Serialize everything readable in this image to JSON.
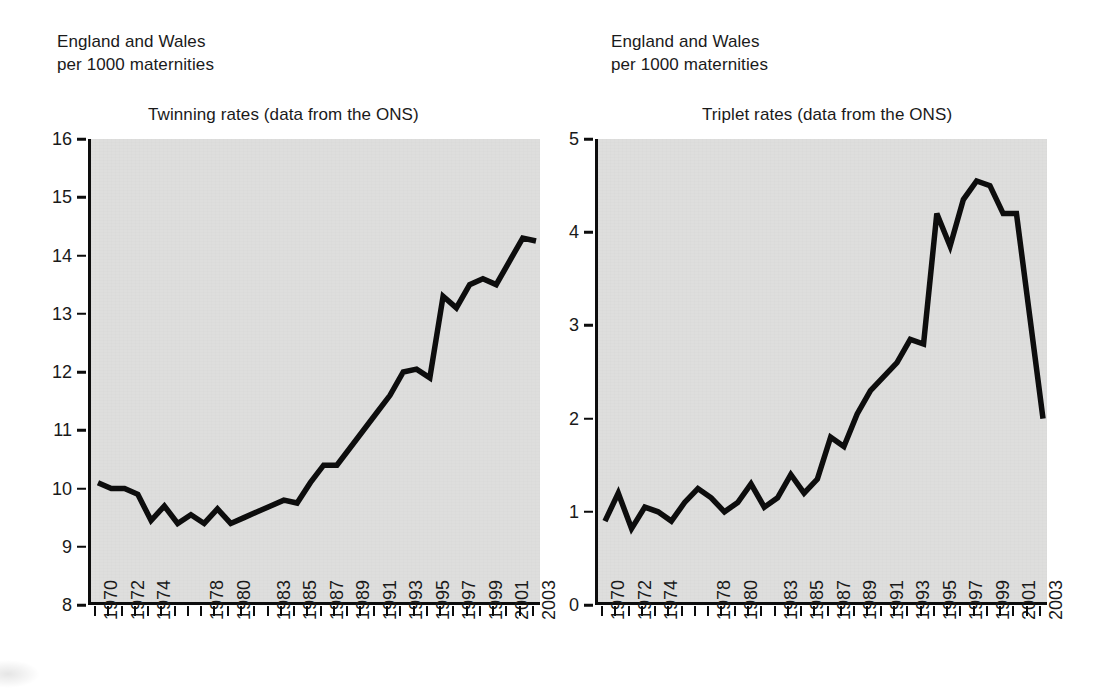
{
  "page": {
    "background_color": "#ffffff",
    "plot_background_color": "#dededd",
    "line_color": "#0d0d0d"
  },
  "left_panel": {
    "caption": "England and Wales\nper 1000 maternities",
    "title": "Twinning rates (data from the ONS)"
  },
  "right_panel": {
    "caption": "England and Wales\nper 1000 maternities",
    "title": "Triplet rates (data from the ONS)"
  },
  "chart_data": [
    {
      "type": "line",
      "title": "Twinning rates (data from the ONS)",
      "subtitle": "England and Wales per 1000 maternities",
      "xlabel": "",
      "ylabel": "per 1000 maternities",
      "ylim": [
        8,
        16
      ],
      "yticks": [
        8,
        9,
        10,
        11,
        12,
        13,
        14,
        15,
        16
      ],
      "xlim": [
        1970,
        2003
      ],
      "xticks": [
        1970,
        1971,
        1972,
        1973,
        1974,
        1975,
        1976,
        1977,
        1978,
        1979,
        1980,
        1981,
        1982,
        1983,
        1984,
        1985,
        1986,
        1987,
        1988,
        1989,
        1990,
        1991,
        1992,
        1993,
        1994,
        1995,
        1996,
        1997,
        1998,
        1999,
        2000,
        2001,
        2002,
        2003
      ],
      "xtick_labels_shown": [
        1970,
        1972,
        1974,
        1978,
        1980,
        1983,
        1985,
        1987,
        1989,
        1991,
        1993,
        1995,
        1997,
        1999,
        2001,
        2003
      ],
      "grid": false,
      "legend": "none",
      "x": [
        1970,
        1971,
        1972,
        1973,
        1974,
        1975,
        1976,
        1977,
        1978,
        1979,
        1980,
        1981,
        1982,
        1983,
        1984,
        1985,
        1986,
        1987,
        1988,
        1989,
        1990,
        1991,
        1992,
        1993,
        1994,
        1995,
        1996,
        1997,
        1998,
        1999,
        2000,
        2001,
        2002,
        2003
      ],
      "values": [
        10.1,
        10.0,
        10.0,
        9.9,
        9.45,
        9.7,
        9.4,
        9.55,
        9.4,
        9.65,
        9.4,
        9.5,
        9.6,
        9.7,
        9.8,
        9.75,
        10.1,
        10.4,
        10.4,
        10.7,
        11.0,
        11.3,
        11.6,
        12.0,
        12.05,
        11.9,
        13.3,
        13.1,
        13.5,
        13.6,
        13.5,
        13.9,
        14.3,
        14.25
      ]
    },
    {
      "type": "line",
      "title": "Triplet rates (data from the ONS)",
      "subtitle": "England and Wales per 1000 maternities",
      "xlabel": "",
      "ylabel": "per 1000 maternities",
      "ylim": [
        0,
        5
      ],
      "yticks": [
        0,
        1,
        2,
        3,
        4,
        5
      ],
      "xlim": [
        1970,
        2003
      ],
      "xticks": [
        1970,
        1971,
        1972,
        1973,
        1974,
        1975,
        1976,
        1977,
        1978,
        1979,
        1980,
        1981,
        1982,
        1983,
        1984,
        1985,
        1986,
        1987,
        1988,
        1989,
        1990,
        1991,
        1992,
        1993,
        1994,
        1995,
        1996,
        1997,
        1998,
        1999,
        2000,
        2001,
        2002,
        2003
      ],
      "xtick_labels_shown": [
        1970,
        1972,
        1974,
        1978,
        1980,
        1983,
        1985,
        1987,
        1989,
        1991,
        1993,
        1995,
        1997,
        1999,
        2001,
        2003
      ],
      "grid": false,
      "legend": "none",
      "x": [
        1970,
        1971,
        1972,
        1973,
        1974,
        1975,
        1976,
        1977,
        1978,
        1979,
        1980,
        1981,
        1982,
        1983,
        1984,
        1985,
        1986,
        1987,
        1988,
        1989,
        1990,
        1991,
        1992,
        1993,
        1994,
        1995,
        1996,
        1997,
        1998,
        1999,
        2000,
        2001,
        2002,
        2003
      ],
      "values": [
        0.9,
        1.2,
        0.82,
        1.05,
        1.0,
        0.9,
        1.1,
        1.25,
        1.15,
        1.0,
        1.1,
        1.3,
        1.05,
        1.15,
        1.4,
        1.2,
        1.35,
        1.8,
        1.7,
        2.05,
        2.3,
        2.45,
        2.6,
        2.85,
        2.8,
        4.2,
        3.85,
        4.35,
        4.55,
        4.5,
        4.2,
        4.2,
        3.1,
        2.0
      ]
    }
  ]
}
